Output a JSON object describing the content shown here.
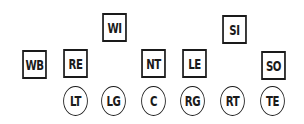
{
  "diagram": {
    "title": "",
    "defense": [
      {
        "id": "WB",
        "label": "WB",
        "shape": "square",
        "x": 20,
        "y": 50
      },
      {
        "id": "RE",
        "label": "RE",
        "shape": "square",
        "x": 61,
        "y": 49
      },
      {
        "id": "WI",
        "label": "WI",
        "shape": "square",
        "x": 100,
        "y": 13
      },
      {
        "id": "NT",
        "label": "NT",
        "shape": "square",
        "x": 139,
        "y": 49
      },
      {
        "id": "LE",
        "label": "LE",
        "shape": "square",
        "x": 180,
        "y": 49
      },
      {
        "id": "SI",
        "label": "SI",
        "shape": "square",
        "x": 220,
        "y": 15
      },
      {
        "id": "SO",
        "label": "SO",
        "shape": "square",
        "x": 259,
        "y": 51
      }
    ],
    "offense": [
      {
        "id": "LT",
        "label": "LT",
        "shape": "circle",
        "x": 61,
        "y": 86
      },
      {
        "id": "LG",
        "label": "LG",
        "shape": "circle",
        "x": 99,
        "y": 86
      },
      {
        "id": "C",
        "label": "C",
        "shape": "circle",
        "x": 139,
        "y": 86
      },
      {
        "id": "RG",
        "label": "RG",
        "shape": "circle",
        "x": 178,
        "y": 86
      },
      {
        "id": "RT",
        "label": "RT",
        "shape": "circle",
        "x": 218,
        "y": 86
      },
      {
        "id": "TE",
        "label": "TE",
        "shape": "circle",
        "x": 258,
        "y": 86
      }
    ],
    "colors": {
      "stroke": "#1a1a1a",
      "background": "#ffffff"
    }
  }
}
